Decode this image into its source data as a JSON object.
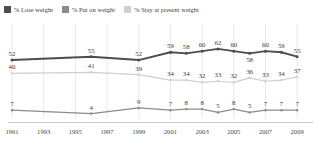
{
  "legend": {
    "items": [
      {
        "label": "% Lose weight",
        "color": "#4d4d4d",
        "icon": "square-swatch"
      },
      {
        "label": "% Put on weight",
        "color": "#8c8c8c",
        "icon": "square-swatch"
      },
      {
        "label": "% Stay at present weight",
        "color": "#cfcfcf",
        "icon": "square-swatch"
      }
    ]
  },
  "chart_data": {
    "type": "line",
    "title": "",
    "xlabel": "",
    "ylabel": "",
    "ylim": [
      0,
      70
    ],
    "grid": true,
    "legend_position": "top-left",
    "x": [
      1991,
      1996,
      1999,
      2001,
      2002,
      2003,
      2004,
      2005,
      2006,
      2007,
      2008,
      2009
    ],
    "xtick_labels": [
      "1991",
      "1993",
      "1995",
      "1997",
      "1999",
      "2001",
      "2003",
      "2005",
      "2007",
      "2009"
    ],
    "series": [
      {
        "name": "% Lose weight",
        "color": "#4d4d4d",
        "values": [
          52,
          55,
          52,
          59,
          58,
          60,
          62,
          60,
          58,
          60,
          59,
          55
        ]
      },
      {
        "name": "% Stay at present weight",
        "color": "#cfcfcf",
        "values": [
          40,
          41,
          39,
          34,
          34,
          32,
          33,
          32,
          36,
          33,
          34,
          37
        ]
      },
      {
        "name": "% Put on weight",
        "color": "#8c8c8c",
        "values": [
          7,
          4,
          9,
          7,
          8,
          8,
          5,
          8,
          5,
          7,
          7,
          7
        ]
      }
    ]
  }
}
